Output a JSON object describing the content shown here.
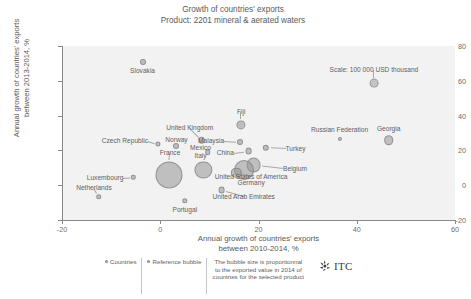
{
  "title": {
    "line1": "Growth of countries' exports",
    "line2": "Product: 2201 mineral & aerated waters"
  },
  "legend": {
    "countries_label": "Countries",
    "reference_label": "Reference bubble",
    "note": "The bubble size is proportionnal to the exported value in 2014 of countries for the selected product",
    "logo_text": "ITC"
  },
  "chart_data": {
    "type": "scatter",
    "title": "Growth of countries' exports",
    "subtitle": "Product: 2201 mineral & aerated waters",
    "xlabel_line1": "Annual growth of countries' exports",
    "xlabel_line2": "between 2010-2014, %",
    "ylabel_line1": "Annual growth of countries' exports",
    "ylabel_line2": "between 2013-2014, %",
    "xlim": [
      -20,
      60
    ],
    "ylim": [
      -20,
      80
    ],
    "xticks": [
      -20,
      0,
      20,
      40,
      60
    ],
    "yticks": [
      -20,
      0,
      20,
      40,
      60,
      80
    ],
    "grid": false,
    "size_units": "USD thousand",
    "scale_annotation": "Scale: 100 000 USD thousand",
    "points": [
      {
        "name": "Slovakia",
        "x": -3.6,
        "y": 71.0,
        "r": 3.0,
        "lx": -3.6,
        "ly": 65.5,
        "anchor": "mid"
      },
      {
        "name": "Fiji",
        "x": 16.5,
        "y": 34.5,
        "r": 4.6,
        "lx": 16.5,
        "ly": 42.0,
        "anchor": "mid"
      },
      {
        "name": "United Kingdom",
        "x": 8.4,
        "y": 26.0,
        "r": 3.3,
        "lx": 6.0,
        "ly": 33.0,
        "anchor": "mid"
      },
      {
        "name": "Malaysia",
        "x": 16.2,
        "y": 25.0,
        "r": 3.0,
        "lx": 13.0,
        "ly": 25.5,
        "anchor": "end"
      },
      {
        "name": "Turkey",
        "x": 21.5,
        "y": 21.5,
        "r": 3.2,
        "lx": 25.5,
        "ly": 21.0,
        "anchor": "start"
      },
      {
        "name": "China",
        "x": 18.0,
        "y": 19.5,
        "r": 3.4,
        "lx": 15.0,
        "ly": 18.5,
        "anchor": "end"
      },
      {
        "name": "Czech Republic",
        "x": -0.5,
        "y": 23.5,
        "r": 2.6,
        "lx": -2.5,
        "ly": 25.5,
        "anchor": "end"
      },
      {
        "name": "Norway",
        "x": 3.3,
        "y": 22.5,
        "r": 3.0,
        "lx": 3.3,
        "ly": 26.0,
        "anchor": "mid"
      },
      {
        "name": "Mexico",
        "x": 9.7,
        "y": 19.0,
        "r": 2.8,
        "lx": 8.2,
        "ly": 21.5,
        "anchor": "mid"
      },
      {
        "name": "Italy",
        "x": 8.8,
        "y": 9.0,
        "r": 8.6,
        "lx": 8.2,
        "ly": 17.0,
        "anchor": "mid"
      },
      {
        "name": "France",
        "x": 1.7,
        "y": 6.0,
        "r": 13.5,
        "lx": 2.0,
        "ly": 18.5,
        "anchor": "mid"
      },
      {
        "name": "Belgium",
        "x": 19.0,
        "y": 11.5,
        "r": 7.4,
        "lx": 25.0,
        "ly": 9.5,
        "anchor": "start"
      },
      {
        "name": "Germany",
        "x": 17.0,
        "y": 8.5,
        "r": 10.0,
        "lx": 18.5,
        "ly": 1.5,
        "anchor": "mid"
      },
      {
        "name": "United States of America",
        "x": 15.5,
        "y": 7.0,
        "r": 5.2,
        "lx": 18.5,
        "ly": 4.5,
        "anchor": "mid"
      },
      {
        "name": "Luxembourg",
        "x": -5.5,
        "y": 4.5,
        "r": 2.2,
        "lx": -7.5,
        "ly": 4.0,
        "anchor": "end"
      },
      {
        "name": "Netherlands",
        "x": -12.5,
        "y": -6.5,
        "r": 2.8,
        "lx": -13.5,
        "ly": -1.5,
        "anchor": "mid"
      },
      {
        "name": "Portugal",
        "x": 5.0,
        "y": -9.0,
        "r": 2.7,
        "lx": 5.0,
        "ly": -14.0,
        "anchor": "mid"
      },
      {
        "name": "United Arab Emirates",
        "x": 12.5,
        "y": -3.0,
        "r": 3.4,
        "lx": 17.0,
        "ly": -6.5,
        "anchor": "mid"
      },
      {
        "name": "Russian Federation",
        "x": 36.5,
        "y": 26.5,
        "r": 2.1,
        "lx": 36.5,
        "ly": 31.5,
        "anchor": "mid"
      },
      {
        "name": "Georgia",
        "x": 46.5,
        "y": 26.0,
        "r": 4.8,
        "lx": 46.5,
        "ly": 32.5,
        "anchor": "mid"
      },
      {
        "name": "Scale: 100 000 USD thousand",
        "x": 43.5,
        "y": 58.5,
        "r": 4.4,
        "lx": 43.5,
        "ly": 66.0,
        "anchor": "mid",
        "is_reference": true
      }
    ]
  }
}
